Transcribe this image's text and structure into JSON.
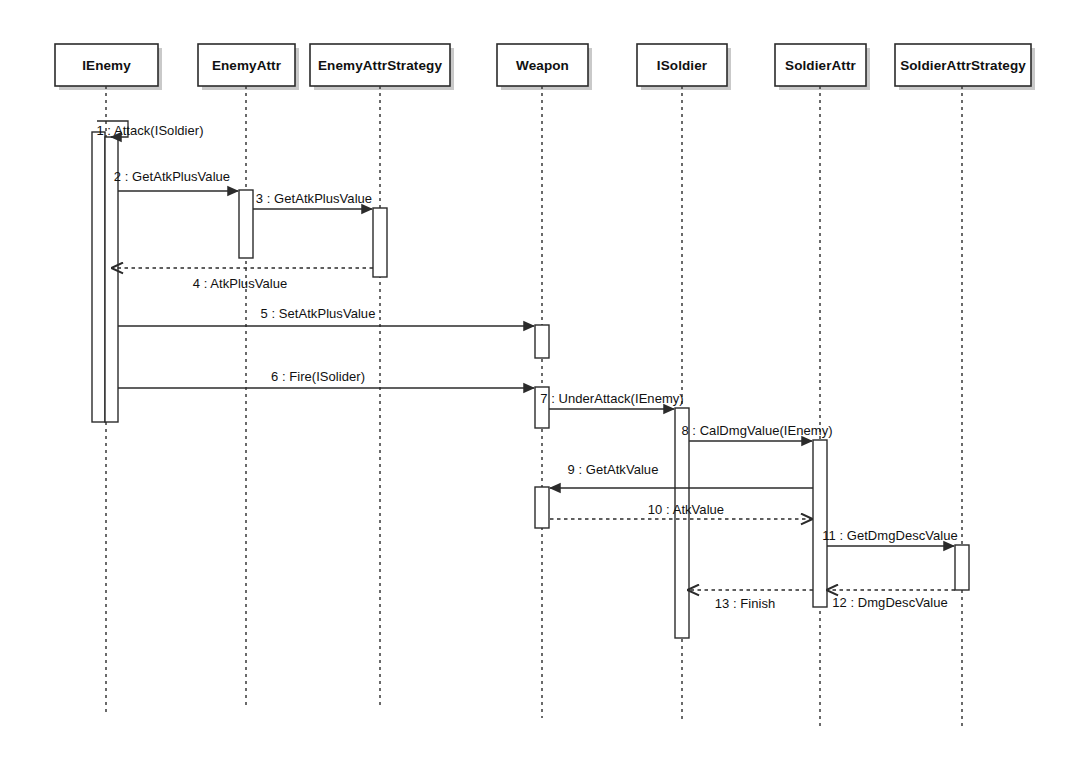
{
  "diagram": {
    "type": "uml-sequence-diagram",
    "title": "",
    "background_color": "#ffffff",
    "line_color": "#2b2b2b",
    "text_color": "#111111",
    "lifelines": [
      {
        "id": "ienemy",
        "label": "IEnemy",
        "x": 106,
        "box_x": 55,
        "box_y": 44,
        "box_w": 103,
        "box_h": 42,
        "bottom": 712
      },
      {
        "id": "enemyattr",
        "label": "EnemyAttr",
        "x": 246,
        "box_x": 198,
        "box_y": 44,
        "box_w": 97,
        "box_h": 42,
        "bottom": 706
      },
      {
        "id": "enemyattrstrategy",
        "label": "EnemyAttrStrategy",
        "x": 380,
        "box_x": 310,
        "box_y": 44,
        "box_w": 140,
        "box_h": 42,
        "bottom": 708
      },
      {
        "id": "weapon",
        "label": "Weapon",
        "x": 542,
        "box_x": 497,
        "box_y": 44,
        "box_w": 91,
        "box_h": 42,
        "bottom": 718
      },
      {
        "id": "isoldier",
        "label": "ISoldier",
        "x": 682,
        "box_x": 637,
        "box_y": 44,
        "box_w": 90,
        "box_h": 42,
        "bottom": 722
      },
      {
        "id": "soldierattr",
        "label": "SoldierAttr",
        "x": 820,
        "box_x": 775,
        "box_y": 44,
        "box_w": 91,
        "box_h": 42,
        "bottom": 726
      },
      {
        "id": "soldierattrstrategy",
        "label": "SoldierAttrStrategy",
        "x": 962,
        "box_x": 895,
        "box_y": 44,
        "box_w": 136,
        "box_h": 42,
        "bottom": 730
      }
    ],
    "activations": [
      {
        "id": "act-ienemy-outer",
        "lifeline": "ienemy",
        "x": 92,
        "y": 132,
        "w": 13,
        "h": 290
      },
      {
        "id": "act-ienemy-inner",
        "lifeline": "ienemy",
        "x": 105,
        "y": 137,
        "w": 13,
        "h": 285
      },
      {
        "id": "act-enemyattr",
        "lifeline": "enemyattr",
        "x": 239,
        "y": 190,
        "w": 14,
        "h": 68
      },
      {
        "id": "act-enemyattrstrat",
        "lifeline": "enemyattrstrategy",
        "x": 373,
        "y": 208,
        "w": 14,
        "h": 69
      },
      {
        "id": "act-weapon-1",
        "lifeline": "weapon",
        "x": 535,
        "y": 325,
        "w": 14,
        "h": 33
      },
      {
        "id": "act-weapon-2",
        "lifeline": "weapon",
        "x": 535,
        "y": 387,
        "w": 14,
        "h": 41
      },
      {
        "id": "act-weapon-3",
        "lifeline": "weapon",
        "x": 535,
        "y": 487,
        "w": 14,
        "h": 41
      },
      {
        "id": "act-isoldier",
        "lifeline": "isoldier",
        "x": 675,
        "y": 408,
        "w": 14,
        "h": 230
      },
      {
        "id": "act-soldierattr",
        "lifeline": "soldierattr",
        "x": 813,
        "y": 440,
        "w": 14,
        "h": 167
      },
      {
        "id": "act-soldierattrstr",
        "lifeline": "soldierattrstrategy",
        "x": 955,
        "y": 545,
        "w": 14,
        "h": 45
      }
    ],
    "messages": [
      {
        "seq": "1",
        "name": "Attack(ISoldier)",
        "label": "1 : Attack(ISoldier)",
        "kind": "self-call",
        "style": "solid",
        "from": "ienemy",
        "to": "ienemy",
        "x1": 97,
        "y1": 121,
        "x2": 128,
        "y2": 137,
        "label_x": 150,
        "label_y": 135,
        "label_anchor": "middle"
      },
      {
        "seq": "2",
        "name": "GetAtkPlusValue",
        "label": "2 : GetAtkPlusValue",
        "kind": "call",
        "style": "solid",
        "from": "ienemy",
        "to": "enemyattr",
        "x1": 118,
        "y1": 191,
        "x2": 238,
        "y2": 191,
        "label_x": 172,
        "label_y": 181,
        "label_anchor": "middle"
      },
      {
        "seq": "3",
        "name": "GetAtkPlusValue",
        "label": "3 : GetAtkPlusValue",
        "kind": "call",
        "style": "solid",
        "from": "enemyattr",
        "to": "enemyattrstrategy",
        "x1": 253,
        "y1": 209,
        "x2": 372,
        "y2": 209,
        "label_x": 314,
        "label_y": 203,
        "label_anchor": "middle"
      },
      {
        "seq": "4",
        "name": "AtkPlusValue",
        "label": "4 : AtkPlusValue",
        "kind": "return",
        "style": "dashed",
        "from": "enemyattrstrategy",
        "to": "ienemy",
        "x1": 373,
        "y1": 268,
        "x2": 112,
        "y2": 268,
        "label_x": 240,
        "label_y": 288,
        "label_anchor": "middle"
      },
      {
        "seq": "5",
        "name": "SetAtkPlusValue",
        "label": "5 : SetAtkPlusValue",
        "kind": "call",
        "style": "solid",
        "from": "ienemy",
        "to": "weapon",
        "x1": 118,
        "y1": 326,
        "x2": 534,
        "y2": 326,
        "label_x": 318,
        "label_y": 318,
        "label_anchor": "middle"
      },
      {
        "seq": "6",
        "name": "Fire(ISolider)",
        "label": "6 : Fire(ISolider)",
        "kind": "call",
        "style": "solid",
        "from": "ienemy",
        "to": "weapon",
        "x1": 118,
        "y1": 388,
        "x2": 534,
        "y2": 388,
        "label_x": 318,
        "label_y": 381,
        "label_anchor": "middle"
      },
      {
        "seq": "7",
        "name": "UnderAttack(IEnemy)",
        "label": "7 : UnderAttack(IEnemy)",
        "kind": "call",
        "style": "solid",
        "from": "weapon",
        "to": "isoldier",
        "x1": 549,
        "y1": 409,
        "x2": 674,
        "y2": 409,
        "label_x": 612,
        "label_y": 403,
        "label_anchor": "middle"
      },
      {
        "seq": "8",
        "name": "CalDmgValue(IEnemy)",
        "label": "8 : CalDmgValue(IEnemy)",
        "kind": "call",
        "style": "solid",
        "from": "isoldier",
        "to": "soldierattr",
        "x1": 689,
        "y1": 441,
        "x2": 812,
        "y2": 441,
        "label_x": 757,
        "label_y": 435,
        "label_anchor": "middle"
      },
      {
        "seq": "9",
        "name": "GetAtkValue",
        "label": "9 : GetAtkValue",
        "kind": "call",
        "style": "solid",
        "from": "soldierattr",
        "to": "weapon",
        "x1": 813,
        "y1": 488,
        "x2": 550,
        "y2": 488,
        "label_x": 613,
        "label_y": 474,
        "label_anchor": "middle"
      },
      {
        "seq": "10",
        "name": "AtkValue",
        "label": "10 : AtkValue",
        "kind": "return",
        "style": "dashed",
        "from": "weapon",
        "to": "soldierattr",
        "x1": 550,
        "y1": 519,
        "x2": 812,
        "y2": 519,
        "label_x": 686,
        "label_y": 514,
        "label_anchor": "middle"
      },
      {
        "seq": "11",
        "name": "GetDmgDescValue",
        "label": "11 : GetDmgDescValue",
        "kind": "call",
        "style": "solid",
        "from": "soldierattr",
        "to": "soldierattrstrategy",
        "x1": 827,
        "y1": 546,
        "x2": 954,
        "y2": 546,
        "label_x": 890,
        "label_y": 540,
        "label_anchor": "middle"
      },
      {
        "seq": "12",
        "name": "DmgDescValue",
        "label": "12 : DmgDescValue",
        "kind": "return",
        "style": "dashed",
        "from": "soldierattrstrategy",
        "to": "soldierattr",
        "x1": 955,
        "y1": 590,
        "x2": 827,
        "y2": 590,
        "label_x": 890,
        "label_y": 607,
        "label_anchor": "middle"
      },
      {
        "seq": "13",
        "name": "Finish",
        "label": "13 : Finish",
        "kind": "return",
        "style": "dashed",
        "from": "soldierattr",
        "to": "isoldier",
        "x1": 813,
        "y1": 590,
        "x2": 688,
        "y2": 590,
        "label_x": 745,
        "label_y": 608,
        "label_anchor": "middle"
      }
    ]
  }
}
